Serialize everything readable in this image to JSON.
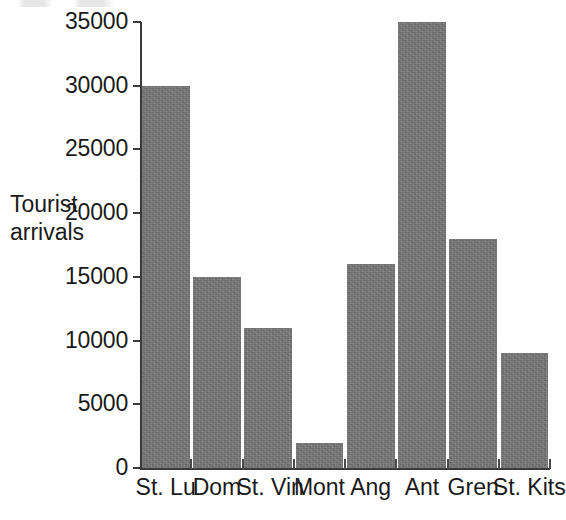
{
  "chart_data": {
    "type": "bar",
    "title": "",
    "subtitle": "",
    "xlabel": "",
    "ylabel": "Tourist\narrivals",
    "ylim": [
      0,
      35000
    ],
    "ytick_values": [
      0,
      5000,
      10000,
      15000,
      20000,
      25000,
      30000,
      35000
    ],
    "ytick_labels": [
      "0",
      "5000",
      "10000",
      "15000",
      "20000",
      "25000",
      "30000",
      "35000"
    ],
    "grid": false,
    "legend": null,
    "categories": [
      "St. Lu",
      "Dom",
      "St. Vin",
      "Mont",
      "Ang",
      "Ant",
      "Gren",
      "St. Kits"
    ],
    "values": [
      30000,
      15000,
      11000,
      2000,
      16000,
      35000,
      18000,
      9000
    ],
    "series": [
      {
        "name": "Tourist arrivals",
        "values": [
          30000,
          15000,
          11000,
          2000,
          16000,
          35000,
          18000,
          9000
        ]
      }
    ],
    "bar_color": "#787878",
    "axis_color": "#3a3a3a",
    "background_color": "#ffffff"
  },
  "axis": {
    "y_title": "Tourist\narrivals",
    "ticks": [
      {
        "label": "35000",
        "value": 35000
      },
      {
        "label": "30000",
        "value": 30000
      },
      {
        "label": "25000",
        "value": 25000
      },
      {
        "label": "20000",
        "value": 20000
      },
      {
        "label": "15000",
        "value": 15000
      },
      {
        "label": "10000",
        "value": 10000
      },
      {
        "label": "5000",
        "value": 5000
      },
      {
        "label": "0",
        "value": 0
      }
    ]
  },
  "bars": [
    {
      "label": "St. Lu",
      "value": 30000
    },
    {
      "label": "Dom",
      "value": 15000
    },
    {
      "label": "St. Vin",
      "value": 11000
    },
    {
      "label": "Mont",
      "value": 2000
    },
    {
      "label": "Ang",
      "value": 16000
    },
    {
      "label": "Ant",
      "value": 35000
    },
    {
      "label": "Gren",
      "value": 18000
    },
    {
      "label": "St. Kits",
      "value": 9000
    }
  ]
}
